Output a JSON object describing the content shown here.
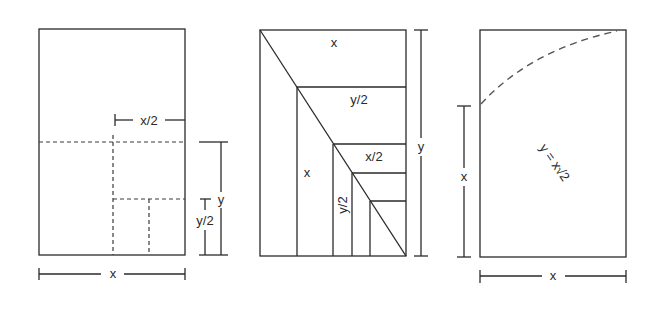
{
  "figures": [
    {
      "name": "halving-rectangle",
      "labels": {
        "half_width": "x/2",
        "height": "y",
        "half_height": "y/2",
        "width": "x"
      }
    },
    {
      "name": "diagonal-subdivision",
      "labels": {
        "top": "x",
        "second": "y/2",
        "third": "x/2",
        "left_column": "x",
        "inner_column": "y/2",
        "height": "y"
      }
    },
    {
      "name": "root-two-rectangle",
      "labels": {
        "side": "x",
        "width": "x",
        "relation": "y = x√2"
      }
    }
  ],
  "colors": {
    "line": "#2a2a2a",
    "arc": "#555555",
    "background": "#ffffff"
  }
}
